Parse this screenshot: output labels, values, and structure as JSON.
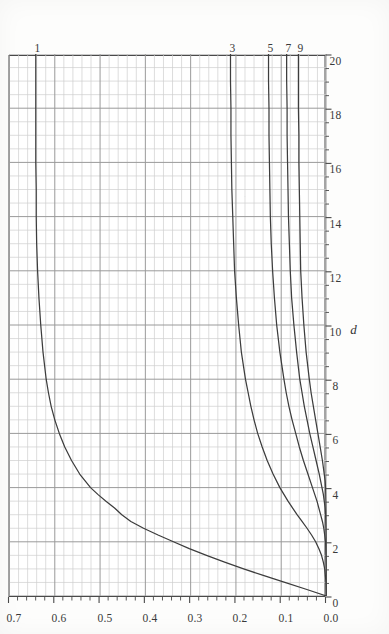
{
  "chart_data": {
    "type": "line",
    "title": "",
    "subtitle": "",
    "xlabel": "d",
    "ylabel": "",
    "xlim": [
      0,
      20
    ],
    "ylim": [
      0.0,
      0.7
    ],
    "xticks": [
      0,
      2,
      4,
      6,
      8,
      10,
      12,
      14,
      16,
      18,
      20
    ],
    "xtick_labels": [
      "0",
      "2",
      "4",
      "6",
      "8",
      "10",
      "12",
      "14",
      "16",
      "18",
      "20"
    ],
    "x_minor_step": 0.5,
    "yticks": [
      0.0,
      0.1,
      0.2,
      0.3,
      0.4,
      0.5,
      0.6,
      0.7
    ],
    "ytick_labels": [
      "0.0",
      "0.1",
      "0.2",
      "0.3",
      "0.4",
      "0.5",
      "0.6",
      "0.7"
    ],
    "y_minor_step": 0.02,
    "grid": true,
    "grid_minor": true,
    "legend": "end-of-line labels at right edge of plot",
    "rotation_degrees": -90,
    "series": [
      {
        "name": "1",
        "label": "1",
        "end_value": 0.642,
        "x": [
          0.0,
          0.25,
          0.5,
          0.75,
          1.0,
          1.25,
          1.5,
          1.75,
          2.0,
          2.25,
          2.5,
          2.75,
          3.0,
          3.25,
          3.5,
          3.75,
          4.0,
          4.5,
          5.0,
          5.5,
          6.0,
          6.5,
          7.0,
          7.5,
          8.0,
          9.0,
          10.0,
          11.0,
          12.0,
          12.5,
          13.0,
          14.0,
          15.0,
          16.0,
          17.0,
          18.0,
          19.0,
          20.0
        ],
        "values": [
          0.0,
          0.045,
          0.092,
          0.138,
          0.183,
          0.225,
          0.265,
          0.303,
          0.338,
          0.372,
          0.404,
          0.432,
          0.452,
          0.468,
          0.487,
          0.505,
          0.521,
          0.545,
          0.563,
          0.578,
          0.59,
          0.6,
          0.608,
          0.614,
          0.619,
          0.626,
          0.631,
          0.635,
          0.638,
          0.639,
          0.64,
          0.641,
          0.641,
          0.642,
          0.642,
          0.642,
          0.642,
          0.642
        ]
      },
      {
        "name": "3",
        "label": "3",
        "end_value": 0.212,
        "x": [
          0.0,
          0.5,
          1.0,
          1.25,
          1.5,
          1.75,
          2.0,
          2.25,
          2.5,
          2.75,
          3.0,
          3.5,
          4.0,
          4.5,
          5.0,
          5.5,
          6.0,
          6.5,
          7.0,
          7.5,
          8.0,
          9.0,
          10.0,
          11.0,
          12.0,
          13.0,
          14.0,
          15.0,
          16.0,
          17.0,
          18.0,
          19.0,
          20.0
        ],
        "values": [
          0.0,
          0.001,
          0.004,
          0.007,
          0.011,
          0.017,
          0.024,
          0.033,
          0.043,
          0.054,
          0.065,
          0.085,
          0.103,
          0.118,
          0.131,
          0.142,
          0.152,
          0.16,
          0.167,
          0.173,
          0.179,
          0.188,
          0.194,
          0.199,
          0.203,
          0.205,
          0.207,
          0.209,
          0.21,
          0.211,
          0.211,
          0.212,
          0.212
        ]
      },
      {
        "name": "5",
        "label": "5",
        "end_value": 0.128,
        "x": [
          0.0,
          0.5,
          1.0,
          1.5,
          2.0,
          2.25,
          2.5,
          2.75,
          3.0,
          3.5,
          4.0,
          4.5,
          5.0,
          5.5,
          6.0,
          6.5,
          7.0,
          7.5,
          8.0,
          9.0,
          10.0,
          11.0,
          12.0,
          13.0,
          14.0,
          15.0,
          16.0,
          17.0,
          18.0,
          19.0,
          20.0
        ],
        "values": [
          0.0,
          0.0,
          0.0,
          0.001,
          0.002,
          0.004,
          0.006,
          0.009,
          0.013,
          0.021,
          0.031,
          0.041,
          0.051,
          0.06,
          0.068,
          0.076,
          0.083,
          0.089,
          0.094,
          0.103,
          0.11,
          0.115,
          0.119,
          0.122,
          0.124,
          0.125,
          0.126,
          0.127,
          0.127,
          0.128,
          0.128
        ]
      },
      {
        "name": "7",
        "label": "7",
        "end_value": 0.088,
        "x": [
          0.0,
          1.0,
          1.5,
          2.0,
          2.5,
          3.0,
          3.25,
          3.5,
          3.75,
          4.0,
          4.5,
          5.0,
          5.5,
          6.0,
          6.5,
          7.0,
          7.5,
          8.0,
          9.0,
          10.0,
          11.0,
          12.0,
          13.0,
          14.0,
          15.0,
          16.0,
          17.0,
          18.0,
          19.0,
          20.0
        ],
        "values": [
          0.0,
          0.0,
          0.0,
          0.0,
          0.001,
          0.002,
          0.003,
          0.005,
          0.007,
          0.01,
          0.016,
          0.023,
          0.03,
          0.037,
          0.043,
          0.049,
          0.054,
          0.059,
          0.066,
          0.072,
          0.077,
          0.08,
          0.082,
          0.084,
          0.085,
          0.086,
          0.087,
          0.087,
          0.088,
          0.088
        ]
      },
      {
        "name": "9",
        "label": "9",
        "end_value": 0.062,
        "x": [
          0.0,
          1.0,
          2.0,
          2.5,
          3.0,
          3.5,
          4.0,
          4.25,
          4.5,
          4.75,
          5.0,
          5.5,
          6.0,
          6.5,
          7.0,
          7.5,
          8.0,
          9.0,
          10.0,
          11.0,
          12.0,
          13.0,
          14.0,
          15.0,
          16.0,
          17.0,
          18.0,
          19.0,
          20.0
        ],
        "values": [
          0.0,
          0.0,
          0.0,
          0.0,
          0.0,
          0.001,
          0.002,
          0.003,
          0.005,
          0.007,
          0.009,
          0.014,
          0.019,
          0.024,
          0.029,
          0.034,
          0.038,
          0.045,
          0.05,
          0.054,
          0.057,
          0.058,
          0.059,
          0.06,
          0.061,
          0.061,
          0.062,
          0.062,
          0.062
        ]
      }
    ]
  },
  "style": {
    "curve_color": "#3d3d3d",
    "frame_color": "#4a4a4a",
    "grid_major_color": "#9a9a9a",
    "grid_minor_color": "#cfcfcf",
    "background": "#ffffff",
    "text_color": "#3a3a3a"
  },
  "axis": {
    "x_title": "d",
    "x_tick_labels": [
      "0",
      "2",
      "4",
      "6",
      "8",
      "10",
      "12",
      "14",
      "16",
      "18",
      "20"
    ],
    "y_tick_labels": [
      "0.0",
      "0.1",
      "0.2",
      "0.3",
      "0.4",
      "0.5",
      "0.6",
      "0.7"
    ]
  },
  "series_labels": [
    "1",
    "3",
    "5",
    "7",
    "9"
  ]
}
